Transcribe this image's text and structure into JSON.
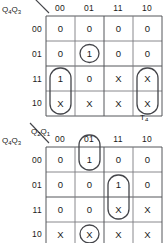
{
  "figure": {
    "kind": "karnaugh-map-pair",
    "maps": [
      {
        "id": "map-t4",
        "output_label": "T",
        "output_subscript": "4",
        "row_variables_label": "Q",
        "row_variables_sub1": "4",
        "row_variables_sub2": "3",
        "col_variables_label": "Q",
        "col_variables_sub1": "2",
        "col_variables_sub2": "1",
        "col_headers": [
          "00",
          "01",
          "11",
          "10"
        ],
        "row_headers": [
          "00",
          "01",
          "11",
          "10"
        ],
        "cells": [
          [
            "0",
            "0",
            "0",
            "0"
          ],
          [
            "0",
            "1",
            "0",
            "0"
          ],
          [
            "1",
            "0",
            "X",
            "X"
          ],
          [
            "X",
            "X",
            "X",
            "X"
          ]
        ],
        "groups": [
          {
            "name": "single-cell-group-r1c1",
            "shape": "circle",
            "row": 1,
            "col": 1,
            "rows": 1,
            "cols": 1
          },
          {
            "name": "vertical-pair-group-c0",
            "shape": "oval",
            "row": 2,
            "col": 0,
            "rows": 2,
            "cols": 1
          },
          {
            "name": "vertical-pair-group-c3",
            "shape": "oval",
            "row": 2,
            "col": 3,
            "rows": 2,
            "cols": 1
          }
        ]
      },
      {
        "id": "map-t3",
        "output_label": "",
        "output_subscript": "",
        "row_variables_label": "Q",
        "row_variables_sub1": "4",
        "row_variables_sub2": "3",
        "col_variables_label": "Q",
        "col_variables_sub1": "2",
        "col_variables_sub2": "1",
        "col_headers": [
          "00",
          "01",
          "11",
          "10"
        ],
        "row_headers": [
          "00",
          "01",
          "11",
          "10"
        ],
        "cells": [
          [
            "0",
            "1",
            "0",
            "0"
          ],
          [
            "0",
            "0",
            "1",
            "0"
          ],
          [
            "0",
            "0",
            "X",
            "X"
          ],
          [
            "X",
            "X",
            "X",
            "X"
          ]
        ],
        "groups": [
          {
            "name": "top-edge-group-c1",
            "shape": "oval-open-top",
            "row": 0,
            "col": 1,
            "rows": 1,
            "cols": 1
          },
          {
            "name": "vertical-pair-group-c2",
            "shape": "oval",
            "row": 1,
            "col": 2,
            "rows": 2,
            "cols": 1
          },
          {
            "name": "single-cell-group-r3c1",
            "shape": "circle",
            "row": 3,
            "col": 1,
            "rows": 1,
            "cols": 1
          }
        ]
      }
    ]
  }
}
